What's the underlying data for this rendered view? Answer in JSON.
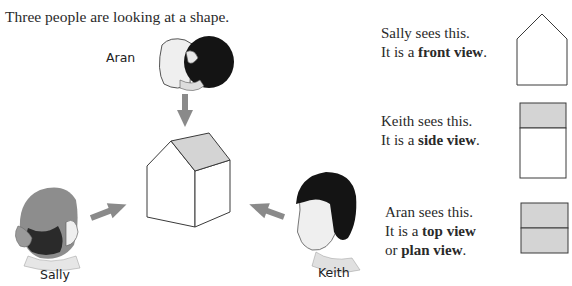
{
  "intro": "Three people are looking at a shape.",
  "people": {
    "aran": "Aran",
    "sally": "Sally",
    "keith": "Keith"
  },
  "views": [
    {
      "line1": "Sally sees this.",
      "line2_prefix": "It is a ",
      "line2_bold": "front view",
      "line2_suffix": ".",
      "shape": "front-view-pentagon"
    },
    {
      "line1": "Keith sees this.",
      "line2_prefix": "It is a ",
      "line2_bold": "side view",
      "line2_suffix": ".",
      "shape": "side-view-rectangle"
    },
    {
      "line1": "Aran sees this.",
      "line2_prefix": "It is a ",
      "line2_bold": "top view",
      "line2_suffix": "",
      "line3_prefix": "or ",
      "line3_bold": "plan view",
      "line3_suffix": ".",
      "shape": "top-view-rectangle"
    }
  ],
  "colors": {
    "roof_fill": "#d4d4d4",
    "arrow": "#8a8a8a",
    "outline": "#3a3a3a",
    "hair_dark": "#141414",
    "hair_sally": "#8d8d8d",
    "skin": "#efefef"
  }
}
